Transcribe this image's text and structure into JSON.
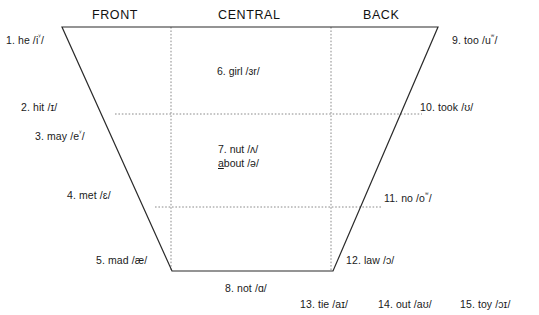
{
  "figure": {
    "type": "vowel-quadrilateral-diagram",
    "title_row": {
      "front": "FRONT",
      "central": "CENTRAL",
      "back": "BACK"
    },
    "outline_color": "#2b2b2b",
    "grid_color": "#808080",
    "background": "#ffffff",
    "trapezoid": {
      "top_left": [
        62,
        27
      ],
      "top_right": [
        438,
        27
      ],
      "bottom_right": [
        333,
        271
      ],
      "bottom_left": [
        172,
        271
      ]
    },
    "grid": {
      "horizontal_y": [
        114,
        207
      ],
      "vertical_x": [
        171,
        331
      ]
    },
    "labels": {
      "front": [
        {
          "num": "1.",
          "word": "he",
          "ipa": "i",
          "offglide": "ʸ"
        },
        {
          "num": "2.",
          "word": "hit",
          "ipa": "ɪ",
          "offglide": ""
        },
        {
          "num": "3.",
          "word": "may",
          "ipa": "e",
          "offglide": "ʸ"
        },
        {
          "num": "4.",
          "word": "met",
          "ipa": "ɛ",
          "offglide": ""
        },
        {
          "num": "5.",
          "word": "mad",
          "ipa": "æ",
          "offglide": ""
        }
      ],
      "central": [
        {
          "num": "6.",
          "word": "girl",
          "ipa": "ɜr",
          "offglide": ""
        },
        {
          "num": "7.",
          "word": "nut",
          "ipa": "ʌ",
          "offglide": ""
        },
        {
          "num": "",
          "word": "about",
          "ipa": "ə",
          "offglide": "",
          "underline_first": true
        },
        {
          "num": "8.",
          "word": "not",
          "ipa": "ɑ",
          "offglide": ""
        }
      ],
      "back": [
        {
          "num": "9.",
          "word": "too",
          "ipa": "u",
          "offglide": "ʷ"
        },
        {
          "num": "10.",
          "word": "took",
          "ipa": "ʊ",
          "offglide": ""
        },
        {
          "num": "11.",
          "word": "no",
          "ipa": "o",
          "offglide": "ʷ"
        },
        {
          "num": "12.",
          "word": "law",
          "ipa": "ɔ",
          "offglide": ""
        }
      ],
      "diphthongs": [
        {
          "num": "13.",
          "word": "tie",
          "ipa": "aɪ",
          "offglide": ""
        },
        {
          "num": "14.",
          "word": "out",
          "ipa": "aʊ",
          "offglide": ""
        },
        {
          "num": "15.",
          "word": "toy",
          "ipa": "ɔɪ",
          "offglide": ""
        }
      ]
    },
    "text": {
      "l1": "1. he /i",
      "l2": "2. hit /ɪ/",
      "l3": "3. may /e",
      "l4": "4. met /ɛ/",
      "l5": "5. mad /æ/",
      "l6": "6. girl /ɜr/",
      "l7a": "7. nut /ʌ/",
      "l7b_pre": "a",
      "l7b_post": "bout /ə/",
      "l8": "8. not /ɑ/",
      "l9": "9. too /u",
      "l10": "10. took /ʊ/",
      "l11": "11. no /o",
      "l12": "12. law /ɔ/",
      "l13": "13. tie /aɪ/",
      "l14": "14. out /aʊ/",
      "l15": "15. toy /ɔɪ/",
      "glide_y": "ʸ",
      "glide_w": "ʷ",
      "slash": "/"
    }
  }
}
